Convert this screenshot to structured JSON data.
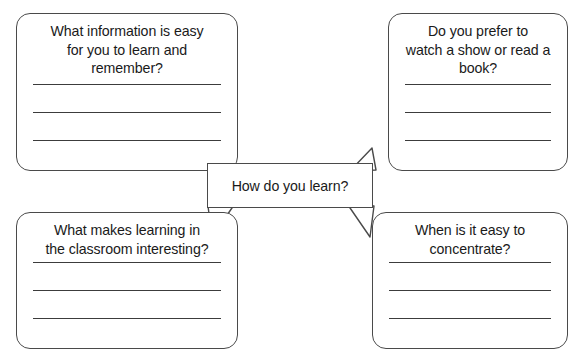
{
  "worksheet": {
    "center": {
      "label": "How do you learn?"
    },
    "bubbles": [
      {
        "id": "top-left",
        "question": "What information is easy\nfor you to learn and\nremember?",
        "answer_lines": [
          "",
          "",
          ""
        ]
      },
      {
        "id": "top-right",
        "question": "Do you prefer to\nwatch a show or read a\nbook?",
        "answer_lines": [
          "",
          "",
          ""
        ]
      },
      {
        "id": "bottom-left",
        "question": "What makes learning in\nthe classroom interesting?",
        "answer_lines": [
          "",
          "",
          ""
        ]
      },
      {
        "id": "bottom-right",
        "question": "When is it easy to\nconcentrate?",
        "answer_lines": [
          "",
          "",
          ""
        ]
      }
    ],
    "colors": {
      "border": "#4a4a4a",
      "text": "#1a1a1a",
      "line": "#3c3c3c",
      "background": "#ffffff"
    }
  }
}
